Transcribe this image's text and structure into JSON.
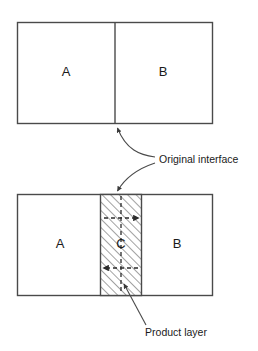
{
  "figure": {
    "background_color": "#ffffff",
    "line_color": "#4a4a4a",
    "text_color": "#1a1a1a",
    "hatch_color": "#555555"
  },
  "panels": [
    {
      "id": "before",
      "name": "initial-couple",
      "regions": [
        {
          "key": "a_top",
          "label": "A"
        },
        {
          "key": "b_top",
          "label": "B"
        }
      ]
    },
    {
      "id": "after",
      "name": "reacted-couple",
      "regions": [
        {
          "key": "a_bottom",
          "label": "A"
        },
        {
          "key": "c_layer",
          "label": "C"
        },
        {
          "key": "b_bottom",
          "label": "B"
        }
      ]
    }
  ],
  "labels": {
    "a_top": "A",
    "b_top": "B",
    "a_bottom": "A",
    "c_layer": "C",
    "b_bottom": "B"
  },
  "annotations": [
    {
      "key": "original_interface",
      "text": "Original interface",
      "targets": [
        "top-panel-divider",
        "product-layer-top-edge"
      ]
    },
    {
      "key": "product_layer",
      "text": "Product layer",
      "targets": [
        "hatched-band"
      ]
    }
  ],
  "annotation_text": {
    "original_interface": "Original interface",
    "product_layer": "Product layer"
  },
  "flux_arrows": [
    {
      "key": "upper",
      "direction": "right",
      "meaning": "A diffusing into C toward B"
    },
    {
      "key": "lower",
      "direction": "left",
      "meaning": "B diffusing into C toward A"
    }
  ]
}
